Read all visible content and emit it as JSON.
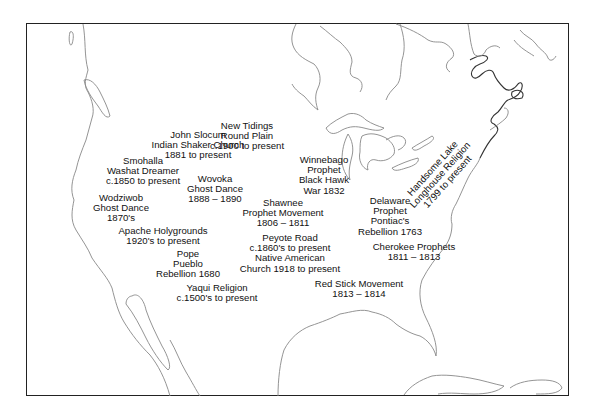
{
  "map": {
    "title": "Native American religious movements",
    "labels": [
      {
        "id": "new-tidings",
        "lines": [
          "New Tidings",
          "Round Plain",
          "c.1900 to present"
        ],
        "x": 247,
        "y": 95
      },
      {
        "id": "john-slocum",
        "lines": [
          "John Slocum",
          "Indian Shaker Church",
          "1881 to present"
        ],
        "x": 198,
        "y": 128
      },
      {
        "id": "smohalla",
        "lines": [
          "Smohalla",
          "Washat Dreamer",
          "c.1850 to present"
        ],
        "x": 143,
        "y": 156
      },
      {
        "id": "wovoka",
        "lines": [
          "Wovoka",
          "Ghost Dance",
          "1888 – 1890"
        ],
        "x": 215,
        "y": 173
      },
      {
        "id": "winnebago",
        "lines": [
          "Winnebago",
          "Prophet",
          "Black Hawk",
          "War  1832"
        ],
        "x": 326,
        "y": 155
      },
      {
        "id": "wodziwob",
        "lines": [
          "Wodziwob",
          "Ghost Dance",
          "1870's"
        ],
        "x": 119,
        "y": 192
      },
      {
        "id": "shawnee",
        "lines": [
          "Shawnee",
          "Prophet Movement",
          "1806 – 1811"
        ],
        "x": 283,
        "y": 199
      },
      {
        "id": "delaware",
        "lines": [
          "Delaware",
          "Prophet",
          "Pontiac's",
          "Rebellion  1763"
        ],
        "x": 389,
        "y": 197
      },
      {
        "id": "apache",
        "lines": [
          "Apache Holygrounds",
          "1920's to present"
        ],
        "x": 162,
        "y": 229
      },
      {
        "id": "peyote",
        "lines": [
          "Peyote Road",
          "c.1860's to present",
          "Native American",
          "Church  1918 to present"
        ],
        "x": 291,
        "y": 233
      },
      {
        "id": "cherokee",
        "lines": [
          "Cherokee Prophets",
          "1811 – 1813"
        ],
        "x": 413,
        "y": 243
      },
      {
        "id": "pope",
        "lines": [
          "Pope",
          "Pueblo",
          "Rebellion  1680"
        ],
        "x": 188,
        "y": 250
      },
      {
        "id": "yaqui",
        "lines": [
          "Yaqui Religion",
          "c.1500's to present"
        ],
        "x": 218,
        "y": 286
      },
      {
        "id": "red-stick",
        "lines": [
          "Red Stick Movement",
          "1813 – 1814"
        ],
        "x": 359,
        "y": 280
      }
    ],
    "rotated_label": {
      "id": "handsome-lake",
      "lines": [
        "Handsome Lake",
        "Longhouse Religion",
        "1799 to present"
      ],
      "x": 440,
      "y": 173,
      "angle": -48
    }
  }
}
